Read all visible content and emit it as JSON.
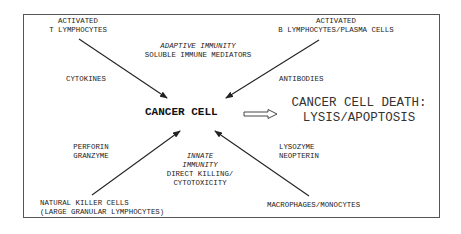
{
  "diagram": {
    "center": "CANCER CELL",
    "outcome": {
      "line1": "CANCER CELL DEATH:",
      "line2": "LYSIS/APOPTOSIS"
    },
    "adaptive": {
      "heading": "ADAPTIVE IMMUNITY",
      "subheading": "SOLUBLE IMMUNE MEDIATORS"
    },
    "innate": {
      "heading1": "INNATE",
      "heading2": "IMMUNITY",
      "sub1": "DIRECT KILLING/",
      "sub2": "CYTOTOXICITY"
    },
    "nodes": {
      "t_cells": {
        "line1": "ACTIVATED",
        "line2": "T LYMPHOCYTES",
        "mediator": "CYTOKINES"
      },
      "b_cells": {
        "line1": "ACTIVATED",
        "line2": "B LYMPHOCYTES/PLASMA CELLS",
        "mediator": "ANTIBODIES"
      },
      "nk_cells": {
        "line1": "NATURAL KILLER CELLS",
        "line2": "(LARGE GRANULAR LYMPHOCYTES)",
        "mediator1": "PERFORIN",
        "mediator2": "GRANZYME"
      },
      "macrophages": {
        "line1": "MACROPHAGES/MONOCYTES",
        "mediator1": "LYSOZYME",
        "mediator2": "NEOPTERIN"
      }
    },
    "colors": {
      "line": "#222222",
      "border": "#555555",
      "background": "#ffffff"
    }
  }
}
